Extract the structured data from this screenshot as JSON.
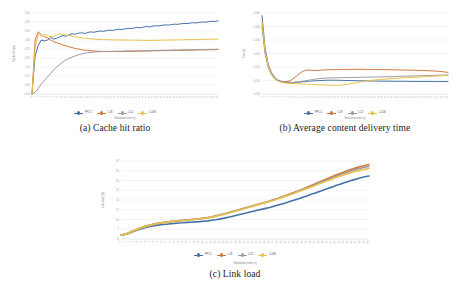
{
  "figure": {
    "background": "#ffffff",
    "palette": {
      "blue": "#4472a8",
      "orange": "#d4763a",
      "gray": "#9c9c9c",
      "yellow": "#e8c14a",
      "grid": "#e4e4e4",
      "axis": "#d9d9d9",
      "tick_text": "#a6a6a6",
      "axis_title": "#7f7f7f"
    },
    "panels": [
      {
        "key": "a",
        "caption": "(a) Cache hit ratio"
      },
      {
        "key": "b",
        "caption": "(b) Average content delivery time"
      },
      {
        "key": "c",
        "caption": "(c) Link load"
      }
    ]
  },
  "legend": {
    "entries": [
      {
        "label": "PPCC",
        "color": "#4472a8"
      },
      {
        "label": "LCE",
        "color": "#d4763a"
      },
      {
        "label": "LCD",
        "color": "#9c9c9c"
      },
      {
        "label": "CL4M",
        "color": "#e8c14a"
      }
    ]
  },
  "chart_data": [
    {
      "id": "cache-hit-ratio",
      "type": "line",
      "title": "",
      "caption": "(a) Cache hit ratio",
      "xlabel": "Simulation time (s)",
      "ylabel": "Cache hit ratio",
      "xlim": [
        0,
        60
      ],
      "ylim": [
        0,
        0.45
      ],
      "yticks": [
        0,
        0.05,
        0.1,
        0.15,
        0.2,
        0.25,
        0.3,
        0.35,
        0.4,
        0.45
      ],
      "grid": true,
      "legend_position": "bottom",
      "x": [
        0,
        1,
        2,
        3,
        4,
        5,
        6,
        7,
        8,
        9,
        10,
        11,
        12,
        13,
        14,
        15,
        16,
        17,
        18,
        19,
        20,
        21,
        22,
        23,
        24,
        25,
        26,
        27,
        28,
        29,
        30,
        31,
        32,
        33,
        34,
        35,
        36,
        37,
        38,
        39,
        40,
        41,
        42,
        43,
        44,
        45,
        46,
        47,
        48,
        49,
        50,
        51,
        52,
        53,
        54,
        55,
        56,
        57,
        58,
        59,
        60
      ],
      "series": [
        {
          "name": "PPCC",
          "color": "#4472a8",
          "values": [
            0.0,
            0.21,
            0.27,
            0.3,
            0.295,
            0.3,
            0.315,
            0.305,
            0.31,
            0.318,
            0.325,
            0.32,
            0.33,
            0.335,
            0.332,
            0.338,
            0.34,
            0.336,
            0.342,
            0.345,
            0.343,
            0.347,
            0.35,
            0.348,
            0.352,
            0.355,
            0.353,
            0.357,
            0.36,
            0.358,
            0.362,
            0.365,
            0.363,
            0.367,
            0.37,
            0.368,
            0.372,
            0.375,
            0.373,
            0.377,
            0.379,
            0.378,
            0.382,
            0.384,
            0.383,
            0.386,
            0.388,
            0.387,
            0.39,
            0.392,
            0.391,
            0.394,
            0.396,
            0.395,
            0.398,
            0.4,
            0.399,
            0.402,
            0.404,
            0.403,
            0.406
          ]
        },
        {
          "name": "LCE",
          "color": "#d4763a",
          "values": [
            0.0,
            0.3,
            0.345,
            0.33,
            0.318,
            0.312,
            0.3,
            0.29,
            0.285,
            0.28,
            0.272,
            0.268,
            0.262,
            0.258,
            0.252,
            0.25,
            0.246,
            0.244,
            0.242,
            0.24,
            0.239,
            0.238,
            0.237,
            0.237,
            0.236,
            0.236,
            0.236,
            0.236,
            0.236,
            0.236,
            0.236,
            0.237,
            0.237,
            0.237,
            0.238,
            0.238,
            0.238,
            0.239,
            0.239,
            0.24,
            0.24,
            0.24,
            0.241,
            0.241,
            0.241,
            0.242,
            0.242,
            0.242,
            0.243,
            0.243,
            0.243,
            0.244,
            0.244,
            0.244,
            0.245,
            0.245,
            0.245,
            0.246,
            0.246,
            0.246,
            0.247
          ]
        },
        {
          "name": "LCD",
          "color": "#9c9c9c",
          "values": [
            0.0,
            0.01,
            0.03,
            0.055,
            0.075,
            0.095,
            0.115,
            0.135,
            0.15,
            0.165,
            0.178,
            0.19,
            0.198,
            0.206,
            0.212,
            0.218,
            0.222,
            0.226,
            0.229,
            0.231,
            0.233,
            0.234,
            0.235,
            0.236,
            0.236,
            0.237,
            0.237,
            0.238,
            0.238,
            0.238,
            0.239,
            0.239,
            0.239,
            0.24,
            0.24,
            0.24,
            0.241,
            0.241,
            0.241,
            0.242,
            0.242,
            0.242,
            0.243,
            0.243,
            0.243,
            0.244,
            0.244,
            0.244,
            0.245,
            0.245,
            0.245,
            0.246,
            0.246,
            0.246,
            0.247,
            0.247,
            0.247,
            0.248,
            0.248,
            0.248,
            0.249
          ]
        },
        {
          "name": "CL4M",
          "color": "#e8c14a",
          "values": [
            0.0,
            0.26,
            0.335,
            0.32,
            0.33,
            0.325,
            0.318,
            0.322,
            0.328,
            0.335,
            0.33,
            0.328,
            0.325,
            0.322,
            0.318,
            0.315,
            0.312,
            0.31,
            0.308,
            0.306,
            0.305,
            0.304,
            0.303,
            0.302,
            0.302,
            0.301,
            0.301,
            0.3,
            0.3,
            0.3,
            0.3,
            0.299,
            0.299,
            0.299,
            0.299,
            0.298,
            0.298,
            0.298,
            0.298,
            0.298,
            0.298,
            0.299,
            0.299,
            0.299,
            0.3,
            0.3,
            0.3,
            0.301,
            0.301,
            0.301,
            0.302,
            0.302,
            0.302,
            0.303,
            0.303,
            0.303,
            0.304,
            0.304,
            0.304,
            0.305,
            0.305
          ]
        }
      ]
    },
    {
      "id": "average-content-delivery-time",
      "type": "line",
      "title": "",
      "caption": "(b) Average content delivery time",
      "xlabel": "Simulation time (s)",
      "ylabel": "Time (s)",
      "xlim": [
        0,
        60
      ],
      "ylim": [
        0,
        0.06
      ],
      "yticks": [
        0,
        0.01,
        0.02,
        0.03,
        0.04,
        0.05,
        0.06
      ],
      "grid": true,
      "legend_position": "bottom",
      "x": [
        0,
        1,
        2,
        3,
        4,
        5,
        6,
        7,
        8,
        9,
        10,
        11,
        12,
        13,
        14,
        15,
        16,
        17,
        18,
        19,
        20,
        21,
        22,
        23,
        24,
        25,
        26,
        27,
        28,
        29,
        30,
        31,
        32,
        33,
        34,
        35,
        36,
        37,
        38,
        39,
        40,
        41,
        42,
        43,
        44,
        45,
        46,
        47,
        48,
        49,
        50,
        51,
        52,
        53,
        54,
        55,
        56,
        57,
        58,
        59,
        60
      ],
      "series": [
        {
          "name": "PPCC",
          "color": "#4472a8",
          "values": [
            0.058,
            0.034,
            0.022,
            0.016,
            0.0125,
            0.0105,
            0.0095,
            0.009,
            0.0088,
            0.0086,
            0.0085,
            0.0086,
            0.0088,
            0.009,
            0.0092,
            0.0094,
            0.0096,
            0.0098,
            0.0099,
            0.01,
            0.0101,
            0.0102,
            0.0102,
            0.0102,
            0.0102,
            0.0101,
            0.0101,
            0.01,
            0.01,
            0.0099,
            0.0099,
            0.0098,
            0.0098,
            0.0097,
            0.0097,
            0.0096,
            0.0096,
            0.0096,
            0.0095,
            0.0095,
            0.0095,
            0.0095,
            0.0094,
            0.0094,
            0.0094,
            0.0094,
            0.0094,
            0.0094,
            0.0093,
            0.0093,
            0.0093,
            0.0093,
            0.0093,
            0.0093,
            0.0093,
            0.0093,
            0.0092,
            0.0092,
            0.0092,
            0.0092,
            0.0092
          ]
        },
        {
          "name": "LCE",
          "color": "#d4763a",
          "values": [
            0.05,
            0.03,
            0.02,
            0.0145,
            0.0115,
            0.01,
            0.0093,
            0.009,
            0.0092,
            0.0098,
            0.0112,
            0.013,
            0.015,
            0.0166,
            0.0175,
            0.0178,
            0.0176,
            0.0174,
            0.0175,
            0.0177,
            0.0178,
            0.0179,
            0.018,
            0.018,
            0.0181,
            0.0181,
            0.0182,
            0.0182,
            0.0182,
            0.0183,
            0.0183,
            0.0183,
            0.0183,
            0.0182,
            0.0182,
            0.0182,
            0.0181,
            0.0181,
            0.0181,
            0.018,
            0.018,
            0.018,
            0.0179,
            0.0179,
            0.0178,
            0.0178,
            0.0177,
            0.0177,
            0.0176,
            0.0176,
            0.0175,
            0.0175,
            0.0174,
            0.0173,
            0.0172,
            0.0171,
            0.017,
            0.0168,
            0.0166,
            0.0163,
            0.016
          ]
        },
        {
          "name": "LCD",
          "color": "#9c9c9c",
          "values": [
            0.052,
            0.031,
            0.021,
            0.015,
            0.0118,
            0.01,
            0.0092,
            0.0088,
            0.0086,
            0.0085,
            0.0086,
            0.0088,
            0.0091,
            0.0094,
            0.0098,
            0.0102,
            0.0106,
            0.011,
            0.0113,
            0.0115,
            0.0117,
            0.0118,
            0.0119,
            0.012,
            0.012,
            0.0121,
            0.0121,
            0.0122,
            0.0122,
            0.0122,
            0.0123,
            0.0123,
            0.0124,
            0.0124,
            0.0125,
            0.0125,
            0.0126,
            0.0126,
            0.0127,
            0.0127,
            0.0128,
            0.0128,
            0.0129,
            0.013,
            0.013,
            0.0131,
            0.0132,
            0.0132,
            0.0133,
            0.0134,
            0.0134,
            0.0135,
            0.0136,
            0.0136,
            0.0137,
            0.0138,
            0.0138,
            0.0139,
            0.014,
            0.014,
            0.0141
          ]
        },
        {
          "name": "CL4M",
          "color": "#e8c14a",
          "values": [
            0.054,
            0.032,
            0.021,
            0.015,
            0.0118,
            0.0098,
            0.0088,
            0.0083,
            0.008,
            0.0078,
            0.0077,
            0.0076,
            0.0075,
            0.0074,
            0.0073,
            0.0072,
            0.0071,
            0.007,
            0.0069,
            0.0068,
            0.0067,
            0.0066,
            0.0065,
            0.0064,
            0.0064,
            0.0065,
            0.0067,
            0.007,
            0.0074,
            0.0078,
            0.0082,
            0.0086,
            0.009,
            0.0094,
            0.0097,
            0.01,
            0.0103,
            0.0105,
            0.0107,
            0.0109,
            0.0111,
            0.0113,
            0.0114,
            0.0116,
            0.0117,
            0.0119,
            0.012,
            0.0121,
            0.0123,
            0.0124,
            0.0125,
            0.0126,
            0.0128,
            0.0129,
            0.013,
            0.0131,
            0.0133,
            0.0134,
            0.0135,
            0.0136,
            0.0138
          ]
        }
      ]
    },
    {
      "id": "link-load",
      "type": "line",
      "title": "",
      "caption": "(c) Link load",
      "xlabel": "Simulation time (s)",
      "ylabel": "Link load (%)",
      "xlim": [
        0,
        60
      ],
      "ylim": [
        0,
        40
      ],
      "yticks": [
        0,
        5,
        10,
        15,
        20,
        25,
        30,
        35,
        40
      ],
      "grid": true,
      "legend_position": "bottom",
      "x": [
        0,
        1,
        2,
        3,
        4,
        5,
        6,
        7,
        8,
        9,
        10,
        11,
        12,
        13,
        14,
        15,
        16,
        17,
        18,
        19,
        20,
        21,
        22,
        23,
        24,
        25,
        26,
        27,
        28,
        29,
        30,
        31,
        32,
        33,
        34,
        35,
        36,
        37,
        38,
        39,
        40,
        41,
        42,
        43,
        44,
        45,
        46,
        47,
        48,
        49,
        50,
        51,
        52,
        53,
        54,
        55,
        56,
        57,
        58,
        59,
        60
      ],
      "series": [
        {
          "name": "PPCC",
          "color": "#4472a8",
          "values": [
            2.0,
            2.3,
            3.0,
            3.8,
            4.6,
            5.3,
            5.9,
            6.4,
            6.8,
            7.1,
            7.4,
            7.6,
            7.8,
            8.0,
            8.2,
            8.3,
            8.5,
            8.6,
            8.8,
            8.9,
            9.1,
            9.3,
            9.6,
            9.9,
            10.3,
            10.7,
            11.2,
            11.7,
            12.2,
            12.7,
            13.2,
            13.7,
            14.2,
            14.7,
            15.2,
            15.7,
            16.2,
            16.8,
            17.4,
            18.0,
            18.6,
            19.3,
            20.0,
            20.7,
            21.4,
            22.1,
            22.9,
            23.6,
            24.4,
            25.1,
            25.9,
            26.6,
            27.4,
            28.1,
            28.8,
            29.5,
            30.2,
            30.8,
            31.4,
            31.9,
            32.3
          ]
        },
        {
          "name": "LCE",
          "color": "#d4763a",
          "values": [
            2.0,
            2.5,
            3.3,
            4.2,
            5.1,
            5.9,
            6.6,
            7.2,
            7.7,
            8.1,
            8.4,
            8.7,
            9.0,
            9.2,
            9.4,
            9.6,
            9.8,
            10.0,
            10.2,
            10.4,
            10.7,
            11.0,
            11.4,
            11.9,
            12.4,
            12.9,
            13.5,
            14.1,
            14.7,
            15.3,
            15.9,
            16.5,
            17.1,
            17.7,
            18.3,
            18.9,
            19.5,
            20.2,
            20.9,
            21.6,
            22.4,
            23.2,
            24.0,
            24.8,
            25.7,
            26.5,
            27.4,
            28.3,
            29.2,
            30.1,
            31.0,
            31.9,
            32.8,
            33.6,
            34.4,
            35.2,
            35.9,
            36.6,
            37.2,
            37.7,
            38.2
          ]
        },
        {
          "name": "LCD",
          "color": "#9c9c9c",
          "values": [
            2.0,
            2.45,
            3.25,
            4.15,
            5.0,
            5.8,
            6.5,
            7.1,
            7.6,
            8.0,
            8.3,
            8.6,
            8.9,
            9.1,
            9.3,
            9.5,
            9.7,
            9.9,
            10.1,
            10.3,
            10.6,
            10.9,
            11.3,
            11.8,
            12.3,
            12.8,
            13.4,
            14.0,
            14.6,
            15.2,
            15.8,
            16.4,
            17.0,
            17.6,
            18.2,
            18.8,
            19.4,
            20.1,
            20.8,
            21.5,
            22.2,
            23.0,
            23.8,
            24.6,
            25.4,
            26.2,
            27.1,
            27.9,
            28.8,
            29.6,
            30.5,
            31.3,
            32.1,
            32.9,
            33.7,
            34.4,
            35.1,
            35.7,
            36.3,
            36.8,
            37.3
          ]
        },
        {
          "name": "CL4M",
          "color": "#e8c14a",
          "values": [
            2.0,
            2.4,
            3.2,
            4.1,
            4.95,
            5.75,
            6.45,
            7.05,
            7.55,
            7.95,
            8.25,
            8.55,
            8.85,
            9.05,
            9.25,
            9.45,
            9.65,
            9.85,
            10.05,
            10.25,
            10.5,
            10.8,
            11.2,
            11.65,
            12.15,
            12.65,
            13.25,
            13.85,
            14.45,
            15.05,
            15.65,
            16.25,
            16.85,
            17.45,
            18.05,
            18.65,
            19.25,
            19.9,
            20.6,
            21.3,
            22.0,
            22.8,
            23.5,
            24.3,
            25.1,
            25.9,
            26.7,
            27.5,
            28.3,
            29.1,
            29.9,
            30.7,
            31.5,
            32.2,
            32.9,
            33.6,
            34.2,
            34.8,
            35.3,
            35.8,
            36.2
          ]
        }
      ]
    }
  ]
}
